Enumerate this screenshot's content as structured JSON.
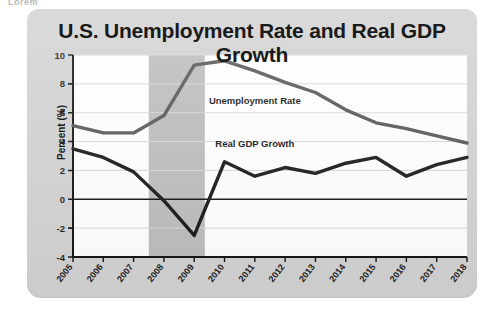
{
  "card": {
    "title": "U.S. Unemployment Rate and Real GDP Growth",
    "background_color": "#d2d2d2",
    "page_background": "#ffffff",
    "clipped_header_text": "Lorem"
  },
  "chart_data": {
    "type": "line",
    "title": "U.S. Unemployment Rate and Real GDP Growth",
    "xlabel": "",
    "ylabel": "Percent (%)",
    "categories": [
      "2005",
      "2006",
      "2007",
      "2008",
      "2009",
      "2010",
      "2011",
      "2012",
      "2013",
      "2014",
      "2015",
      "2016",
      "2017",
      "2018"
    ],
    "x": [
      2005,
      2006,
      2007,
      2008,
      2009,
      2010,
      2011,
      2012,
      2013,
      2014,
      2015,
      2016,
      2017,
      2018
    ],
    "ylim": [
      -4,
      10
    ],
    "yticks": [
      -4,
      -2,
      0,
      2,
      4,
      6,
      8,
      10
    ],
    "ytick_labels": [
      "-4",
      "-2",
      "0",
      "2",
      "4",
      "6",
      "8",
      "10"
    ],
    "grid": true,
    "grid_axis": "y",
    "zero_line": true,
    "legend": "inline-annotations",
    "series": [
      {
        "name": "Unemployment Rate",
        "color": "#555555",
        "linewidth": 3.4,
        "label_x": 2011.0,
        "label_y": 6.6,
        "values": [
          5.1,
          4.6,
          4.6,
          5.8,
          9.3,
          9.6,
          8.9,
          8.1,
          7.4,
          6.2,
          5.3,
          4.9,
          4.4,
          3.9
        ]
      },
      {
        "name": "Real GDP Growth",
        "color": "#161616",
        "linewidth": 3.4,
        "label_x": 2011.0,
        "label_y": 3.6,
        "values": [
          3.5,
          2.9,
          1.9,
          -0.1,
          -2.5,
          2.6,
          1.6,
          2.2,
          1.8,
          2.5,
          2.9,
          1.6,
          2.4,
          2.9
        ]
      }
    ],
    "shaded_regions": [
      {
        "name": "recession-band",
        "x_start": 2007.5,
        "x_end": 2009.35,
        "color": "#bcbcbc"
      }
    ],
    "annotations": [
      {
        "name": "unemployment-rate-label",
        "text": "Unemployment Rate",
        "x": 2011.0,
        "y": 6.6
      },
      {
        "name": "real-gdp-growth-label",
        "text": "Real GDP Growth",
        "x": 2011.0,
        "y": 3.6
      }
    ]
  }
}
